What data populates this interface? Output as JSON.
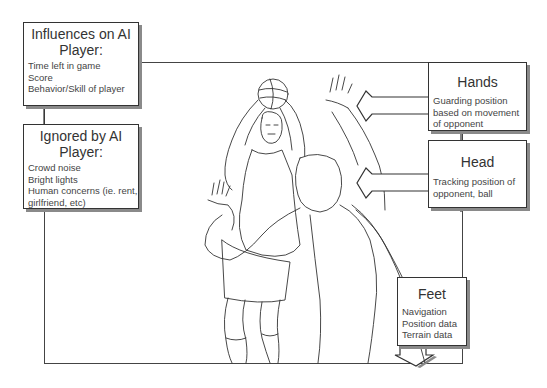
{
  "diagram": {
    "type": "annotated-illustration",
    "illustration_icon": "basketball-players-illustration"
  },
  "boxes": {
    "influences": {
      "title": "Influences on AI Player:",
      "title_line1": "Influences on AI",
      "title_line2": "Player:",
      "items": [
        "Time left in game",
        "Score",
        "Behavior/Skill of player"
      ]
    },
    "ignored": {
      "title": "Ignored by AI Player:",
      "title_line1": "Ignored by AI",
      "title_line2": "Player:",
      "items": [
        "Crowd noise",
        "Bright lights",
        "Human concerns (ie. rent,",
        "girlfriend, etc)"
      ]
    },
    "hands": {
      "title": "Hands",
      "items": [
        "Guarding position",
        "based on movement",
        "of opponent"
      ]
    },
    "head": {
      "title": "Head",
      "items": [
        "Tracking position of",
        "opponent, ball"
      ]
    },
    "feet": {
      "title": "Feet",
      "items": [
        "Navigation",
        "Position data",
        "Terrain data"
      ]
    }
  },
  "colors": {
    "line": "#444444",
    "shadow": "#8a8a8a",
    "background": "#ffffff"
  }
}
